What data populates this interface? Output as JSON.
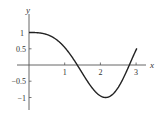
{
  "chart_data": {
    "type": "line",
    "title": "",
    "xlabel": "x",
    "ylabel": "y",
    "xlim": [
      0,
      3.3
    ],
    "ylim": [
      -1.3,
      1.3
    ],
    "grid": false,
    "x_ticks": [
      1,
      2,
      3
    ],
    "x_tick_labels": [
      "1",
      "2",
      "3"
    ],
    "y_ticks": [
      1,
      0.5,
      -0.5,
      -1
    ],
    "y_tick_labels": [
      "1",
      "0.5",
      "−0.5",
      "−1"
    ],
    "series": [
      {
        "name": "f(x)",
        "x": [
          0,
          0.25,
          0.5,
          0.75,
          1.0,
          1.25,
          1.5,
          1.75,
          2.0,
          2.25,
          2.5,
          2.75,
          3.0
        ],
        "values": [
          1.0,
          0.99,
          0.89,
          0.61,
          0.54,
          0.07,
          -0.38,
          -0.79,
          -0.95,
          -0.98,
          -0.69,
          -0.1,
          0.47
        ]
      }
    ]
  },
  "colors": {
    "axis": "#555555",
    "curve": "#222222",
    "text": "#333333"
  }
}
